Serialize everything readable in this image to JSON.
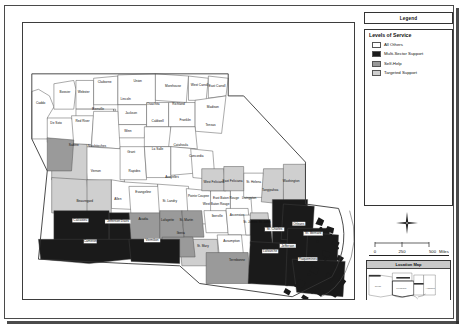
{
  "document": {
    "type": "map-layout",
    "orientation": "landscape"
  },
  "legend_header": {
    "title": "Legend"
  },
  "legend": {
    "heading": "Levels of Service",
    "items": [
      {
        "label": "All Others",
        "color": "#ffffff"
      },
      {
        "label": "Multi-Sector Support",
        "color": "#1a1a1a"
      },
      {
        "label": "Self-Help",
        "color": "#9a9a9a"
      },
      {
        "label": "Targeted Support",
        "color": "#cfcfcf"
      }
    ]
  },
  "north_arrow": {
    "name": "north-arrow",
    "label": ""
  },
  "scalebar": {
    "ticks": [
      "0",
      "250",
      "500"
    ],
    "units": "Miles",
    "full_label": "0     250     500 Miles"
  },
  "location_map": {
    "title": "Location Map",
    "states": [
      "Texas",
      "Louisiana",
      "Arkansas",
      "Mississippi",
      "Alabama"
    ]
  },
  "map": {
    "state": "Louisiana",
    "parishes": [
      {
        "name": "Caddo",
        "x": 16,
        "y": 74,
        "class": "All Others"
      },
      {
        "name": "Bossier",
        "x": 38,
        "y": 64,
        "class": "All Others"
      },
      {
        "name": "Webster",
        "x": 55,
        "y": 64,
        "class": "All Others"
      },
      {
        "name": "Claiborne",
        "x": 74,
        "y": 55,
        "class": "All Others"
      },
      {
        "name": "Union",
        "x": 104,
        "y": 54,
        "class": "All Others"
      },
      {
        "name": "Morehouse",
        "x": 136,
        "y": 58,
        "class": "All Others"
      },
      {
        "name": "West Carroll",
        "x": 160,
        "y": 57,
        "class": "All Others"
      },
      {
        "name": "East Carroll",
        "x": 176,
        "y": 58,
        "class": "All Others"
      },
      {
        "name": "Lincoln",
        "x": 93,
        "y": 70,
        "class": "All Others"
      },
      {
        "name": "Ouachita",
        "x": 118,
        "y": 75,
        "class": "All Others"
      },
      {
        "name": "Richland",
        "x": 141,
        "y": 75,
        "class": "All Others"
      },
      {
        "name": "Madison",
        "x": 172,
        "y": 77,
        "class": "All Others"
      },
      {
        "name": "Bienville",
        "x": 68,
        "y": 79,
        "class": "All Others"
      },
      {
        "name": "Jackson",
        "x": 98,
        "y": 83,
        "class": "All Others"
      },
      {
        "name": "Caldwell",
        "x": 122,
        "y": 90,
        "class": "All Others"
      },
      {
        "name": "Franklin",
        "x": 147,
        "y": 89,
        "class": "All Others"
      },
      {
        "name": "Tensas",
        "x": 170,
        "y": 94,
        "class": "All Others"
      },
      {
        "name": "De Soto",
        "x": 30,
        "y": 92,
        "class": "All Others"
      },
      {
        "name": "Red River",
        "x": 54,
        "y": 90,
        "class": "All Others"
      },
      {
        "name": "Winn",
        "x": 95,
        "y": 99,
        "class": "All Others"
      },
      {
        "name": "Sabine",
        "x": 46,
        "y": 112,
        "class": "Self-Help"
      },
      {
        "name": "Natchitoches",
        "x": 67,
        "y": 113,
        "class": "All Others"
      },
      {
        "name": "Grant",
        "x": 98,
        "y": 118,
        "class": "All Others"
      },
      {
        "name": "La Salle",
        "x": 122,
        "y": 115,
        "class": "All Others"
      },
      {
        "name": "Catahoula",
        "x": 143,
        "y": 112,
        "class": "All Others"
      },
      {
        "name": "Concordia",
        "x": 157,
        "y": 122,
        "class": "All Others"
      },
      {
        "name": "Vernon",
        "x": 66,
        "y": 135,
        "class": "Targeted Support"
      },
      {
        "name": "Rapides",
        "x": 101,
        "y": 135,
        "class": "All Others"
      },
      {
        "name": "Avoyelles",
        "x": 135,
        "y": 141,
        "class": "All Others"
      },
      {
        "name": "Beauregard",
        "x": 56,
        "y": 163,
        "class": "Targeted Support"
      },
      {
        "name": "Allen",
        "x": 86,
        "y": 161,
        "class": "Targeted Support"
      },
      {
        "name": "Evangeline",
        "x": 109,
        "y": 154,
        "class": "All Others"
      },
      {
        "name": "St. Landry",
        "x": 133,
        "y": 163,
        "class": "All Others"
      },
      {
        "name": "Pointe Coupee",
        "x": 159,
        "y": 158,
        "class": "All Others"
      },
      {
        "name": "West Feliciana",
        "x": 173,
        "y": 145,
        "class": "Targeted Support"
      },
      {
        "name": "East Feliciana",
        "x": 190,
        "y": 144,
        "class": "Targeted Support"
      },
      {
        "name": "St. Helena",
        "x": 209,
        "y": 145,
        "class": "All Others"
      },
      {
        "name": "Tangipahoa",
        "x": 224,
        "y": 153,
        "class": "Targeted Support"
      },
      {
        "name": "Washington",
        "x": 243,
        "y": 144,
        "class": "Targeted Support"
      },
      {
        "name": "West Baton Rouge",
        "x": 175,
        "y": 165,
        "class": "All Others"
      },
      {
        "name": "East Baton Rouge",
        "x": 184,
        "y": 160,
        "class": "All Others"
      },
      {
        "name": "Livingston",
        "x": 205,
        "y": 160,
        "class": "All Others"
      },
      {
        "name": "Calcasieu",
        "x": 52,
        "y": 180,
        "class": "Multi-Sector Support"
      },
      {
        "name": "Jefferson Davis",
        "x": 86,
        "y": 181,
        "class": "Multi-Sector Support"
      },
      {
        "name": "Acadia",
        "x": 109,
        "y": 179,
        "class": "Self-Help"
      },
      {
        "name": "Lafayette",
        "x": 131,
        "y": 180,
        "class": "Self-Help"
      },
      {
        "name": "St. Martin",
        "x": 148,
        "y": 180,
        "class": "Self-Help"
      },
      {
        "name": "Iberville",
        "x": 176,
        "y": 176,
        "class": "All Others"
      },
      {
        "name": "Ascension",
        "x": 194,
        "y": 175,
        "class": "All Others"
      },
      {
        "name": "St. James",
        "x": 206,
        "y": 182,
        "class": "All Others"
      },
      {
        "name": "St. John",
        "x": 219,
        "y": 182,
        "class": "Targeted Support"
      },
      {
        "name": "St. Charles",
        "x": 228,
        "y": 188,
        "class": "Multi-Sector Support"
      },
      {
        "name": "Orleans",
        "x": 250,
        "y": 183,
        "class": "Multi-Sector Support"
      },
      {
        "name": "St. Bernard",
        "x": 263,
        "y": 192,
        "class": "Multi-Sector Support"
      },
      {
        "name": "Cameron",
        "x": 61,
        "y": 199,
        "class": "Multi-Sector Support"
      },
      {
        "name": "Vermilion",
        "x": 117,
        "y": 198,
        "class": "Multi-Sector Support"
      },
      {
        "name": "Iberia",
        "x": 143,
        "y": 192,
        "class": "Self-Help"
      },
      {
        "name": "St. Mary",
        "x": 163,
        "y": 203,
        "class": "Targeted Support"
      },
      {
        "name": "Assumption",
        "x": 189,
        "y": 199,
        "class": "All Others"
      },
      {
        "name": "Terrebonne",
        "x": 194,
        "y": 216,
        "class": "Self-Help"
      },
      {
        "name": "Lafourche",
        "x": 224,
        "y": 208,
        "class": "Multi-Sector Support"
      },
      {
        "name": "Jefferson",
        "x": 240,
        "y": 203,
        "class": "Multi-Sector Support"
      },
      {
        "name": "Plaquemines",
        "x": 258,
        "y": 215,
        "class": "Multi-Sector Support"
      }
    ]
  }
}
